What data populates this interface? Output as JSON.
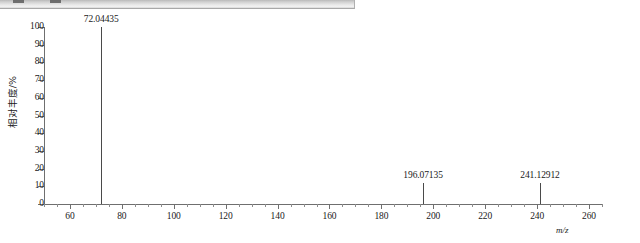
{
  "toolbar": {
    "name": "cut-off-toolbar-strip"
  },
  "chart_data": {
    "type": "bar",
    "title": "",
    "subtitle": "",
    "xlabel": "m/z",
    "ylabel": "相对丰度/%",
    "xlim": [
      50,
      265
    ],
    "ylim": [
      0,
      100
    ],
    "grid": false,
    "legend": null,
    "y_ticks": [
      0,
      10,
      20,
      30,
      40,
      50,
      60,
      70,
      80,
      90,
      100
    ],
    "y_tick_labels": [
      "0",
      "10",
      "20",
      "30",
      "40",
      "50",
      "60",
      "70",
      "80",
      "90",
      "100"
    ],
    "x_ticks": [
      60,
      80,
      100,
      120,
      140,
      160,
      180,
      200,
      220,
      240,
      260
    ],
    "x_tick_labels": [
      "60",
      "80",
      "100",
      "120",
      "140",
      "160",
      "180",
      "200",
      "220",
      "240",
      "260"
    ],
    "x_minor_ticks": [
      50,
      55,
      65,
      70,
      75,
      85,
      90,
      95,
      105,
      110,
      115,
      125,
      130,
      135,
      145,
      150,
      155,
      165,
      170,
      175,
      185,
      190,
      195,
      205,
      210,
      215,
      225,
      230,
      235,
      245,
      250,
      255,
      265
    ],
    "peaks": [
      {
        "mz": 72.04435,
        "label": "72.04435",
        "intensity": 100
      },
      {
        "mz": 196.07135,
        "label": "196.07135",
        "intensity": 12
      },
      {
        "mz": 241.12912,
        "label": "241.12912",
        "intensity": 12
      }
    ],
    "colors": {
      "peak": "#4a4a4a",
      "axis": "#6f6f6f",
      "text": "#1a1a1a",
      "background": "#ffffff"
    }
  }
}
